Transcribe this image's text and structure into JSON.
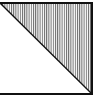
{
  "figure": {
    "shape": "rectangle-split-by-diagonal",
    "hatched_region": "upper-right-triangle",
    "hatch_pattern": "vertical-lines",
    "colors": {
      "background": "#ffffff",
      "stroke": "#111111",
      "hatch": "#555555"
    }
  }
}
